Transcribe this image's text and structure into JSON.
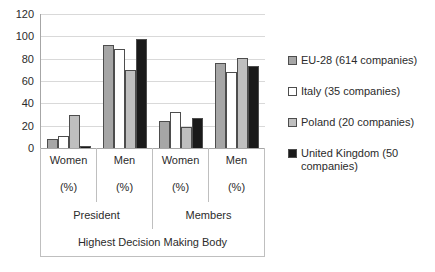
{
  "chart_data": {
    "type": "bar",
    "title": "",
    "xlabel": "Highest Decision Making Body",
    "ylabel": "",
    "ylim": [
      0,
      120
    ],
    "ytick_values": [
      0,
      20,
      40,
      60,
      80,
      100,
      120
    ],
    "ytick_labels": [
      "0",
      "20",
      "40",
      "60",
      "80",
      "100",
      "120"
    ],
    "grid": true,
    "legend_position": "right",
    "categories": [
      "Women (%)",
      "Men (%)",
      "Women (%)",
      "Men (%)"
    ],
    "category_labels": [
      "Women",
      "Men",
      "Women",
      "Men"
    ],
    "category_units": [
      "(%)",
      "(%)",
      "(%)",
      "(%)"
    ],
    "category_groups": [
      "President",
      "Members"
    ],
    "series": [
      {
        "name": "EU-28 (614 companies)",
        "values": [
          8,
          92,
          24,
          76
        ],
        "color": "#a6a6a6"
      },
      {
        "name": "Italy (35 companies)",
        "values": [
          11,
          89,
          32,
          68
        ],
        "color": "#ffffff"
      },
      {
        "name": "Poland (20 companies)",
        "values": [
          30,
          70,
          19,
          81
        ],
        "color": "#bfbfbf"
      },
      {
        "name": "United Kingdom (50 companies)",
        "values": [
          2,
          98,
          27,
          73
        ],
        "color": "#1a1a1a"
      }
    ]
  },
  "axis": {
    "ticks": [
      "120",
      "100",
      "80",
      "60",
      "40",
      "20",
      "0"
    ],
    "categories": [
      {
        "label": "Women",
        "unit": "(%)"
      },
      {
        "label": "Men",
        "unit": "(%)"
      },
      {
        "label": "Women",
        "unit": "(%)"
      },
      {
        "label": "Men",
        "unit": "(%)"
      }
    ],
    "groups": [
      "President",
      "Members"
    ],
    "axis_title": "Highest Decision Making Body"
  },
  "legend": {
    "items": [
      {
        "label": "EU-28 (614 companies)",
        "color": "#a6a6a6"
      },
      {
        "label": "Italy (35 companies)",
        "color": "#ffffff"
      },
      {
        "label": "Poland (20 companies)",
        "color": "#bfbfbf"
      },
      {
        "label": "United Kingdom (50 companies)",
        "color": "#1a1a1a"
      }
    ]
  }
}
